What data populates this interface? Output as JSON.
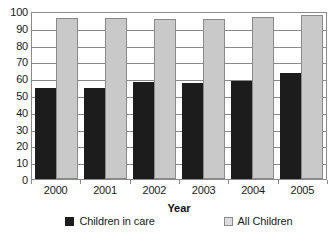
{
  "chart_data": {
    "type": "bar",
    "title": "",
    "subtitle": "",
    "xlabel": "Year",
    "ylabel": "",
    "categories": [
      "2000",
      "2001",
      "2002",
      "2003",
      "2004",
      "2005"
    ],
    "series": [
      {
        "name": "Children in care",
        "color": "#1c1c1c",
        "values": [
          54,
          54,
          58,
          57,
          58.5,
          63
        ]
      },
      {
        "name": "All Children",
        "color": "#c9c9c9",
        "values": [
          96,
          96,
          95.5,
          95.5,
          96.5,
          97.5
        ]
      }
    ],
    "ylim": [
      0,
      100
    ],
    "ytick_step": 10,
    "yticks": [
      100,
      90,
      80,
      70,
      60,
      50,
      40,
      30,
      20,
      10,
      0
    ],
    "grid": true,
    "grid_axis": "y",
    "legend_position": "bottom",
    "bar_mode": "grouped"
  },
  "axes": {
    "y_labels": [
      "100",
      "90",
      "80",
      "70",
      "60",
      "50",
      "40",
      "30",
      "20",
      "10",
      "0"
    ],
    "x_labels": [
      "2000",
      "2001",
      "2002",
      "2003",
      "2004",
      "2005"
    ],
    "x_title": "Year"
  },
  "legend": {
    "entries": [
      {
        "label": "Children in care",
        "swatch": "dark-square-swatch"
      },
      {
        "label": "All Children",
        "swatch": "light-square-swatch"
      }
    ]
  },
  "colors": {
    "series_care": "#1c1c1c",
    "series_all": "#c9c9c9",
    "gridline": "#8a8a8a",
    "axis_border": "#8a8a8a",
    "text": "#1b1b1b",
    "background": "#ffffff"
  }
}
